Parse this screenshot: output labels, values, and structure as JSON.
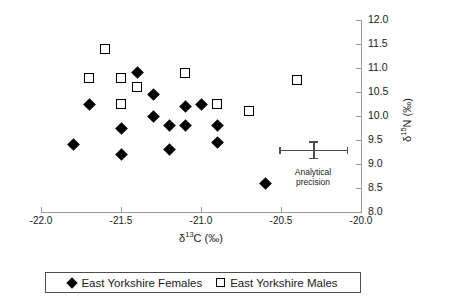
{
  "chart_data": {
    "type": "scatter",
    "title": "",
    "xlabel": "δ13C (‰)",
    "ylabel": "δ15N (‰)",
    "xlabel_parts": {
      "delta": "δ",
      "sup": "13",
      "element": "C (‰)"
    },
    "ylabel_parts": {
      "delta": "δ",
      "sup": "15",
      "element": "N (‰)"
    },
    "xlim": [
      -22.0,
      -20.0
    ],
    "ylim": [
      8.0,
      12.0
    ],
    "x_ticks": [
      -22.0,
      -21.5,
      -21.0,
      -20.5,
      -20.0
    ],
    "y_ticks": [
      8.0,
      8.5,
      9.0,
      9.5,
      10.0,
      10.5,
      11.0,
      11.5,
      12.0
    ],
    "x_tick_labels": [
      "-22.0",
      "-21.5",
      "-21.0",
      "-20.5",
      "-20.0"
    ],
    "y_tick_labels": [
      "8.0",
      "8.5",
      "9.0",
      "9.5",
      "10.0",
      "10.5",
      "11.0",
      "11.5",
      "12.0"
    ],
    "grid": false,
    "y_axis_position": "right",
    "legend_position": "bottom",
    "series": [
      {
        "name": "East Yorkshire Females",
        "marker": "filled-diamond",
        "color": "#000000",
        "points": [
          {
            "x": -21.8,
            "y": 9.4
          },
          {
            "x": -21.7,
            "y": 10.25
          },
          {
            "x": -21.5,
            "y": 9.75
          },
          {
            "x": -21.5,
            "y": 9.2
          },
          {
            "x": -21.4,
            "y": 10.9
          },
          {
            "x": -21.3,
            "y": 10.45
          },
          {
            "x": -21.3,
            "y": 10.0
          },
          {
            "x": -21.2,
            "y": 9.8
          },
          {
            "x": -21.2,
            "y": 9.3
          },
          {
            "x": -21.1,
            "y": 10.2
          },
          {
            "x": -21.1,
            "y": 9.8
          },
          {
            "x": -21.0,
            "y": 10.25
          },
          {
            "x": -20.9,
            "y": 9.8
          },
          {
            "x": -20.9,
            "y": 9.45
          },
          {
            "x": -20.6,
            "y": 8.6
          }
        ]
      },
      {
        "name": "East Yorkshire Males",
        "marker": "open-square",
        "color": "#000000",
        "points": [
          {
            "x": -21.6,
            "y": 11.4
          },
          {
            "x": -21.7,
            "y": 10.8
          },
          {
            "x": -21.5,
            "y": 10.8
          },
          {
            "x": -21.4,
            "y": 10.6
          },
          {
            "x": -21.5,
            "y": 10.25
          },
          {
            "x": -21.1,
            "y": 10.9
          },
          {
            "x": -20.9,
            "y": 10.25
          },
          {
            "x": -20.7,
            "y": 10.1
          },
          {
            "x": -20.4,
            "y": 10.75
          }
        ]
      }
    ],
    "annotations": [
      {
        "name": "analytical-precision",
        "label_line1": "Analytical",
        "label_line2": "precision",
        "center_x": -20.3,
        "center_y": 9.3,
        "x_error": 0.21,
        "y_error": 0.17
      }
    ]
  },
  "legend": {
    "entries": [
      {
        "label": "East Yorkshire Females",
        "marker": "filled-diamond"
      },
      {
        "label": "East Yorkshire Males",
        "marker": "open-square"
      }
    ]
  }
}
